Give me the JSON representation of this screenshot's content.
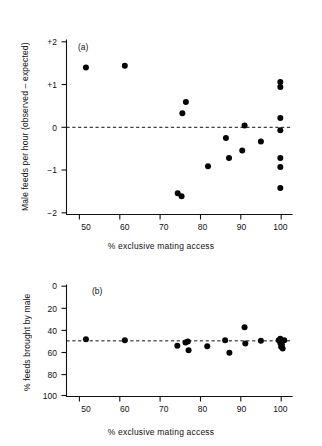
{
  "figure": {
    "background": "#ffffff",
    "ink": "#111111",
    "dot_color": "#050505",
    "width": 322,
    "height": 446
  },
  "panel_a": {
    "tag": "(a)",
    "xlabel": "% exclusive mating access",
    "ylabel": "Male feeds per hour (observed – expected)",
    "xticks": [
      "50",
      "60",
      "70",
      "80",
      "90",
      "100"
    ],
    "yticks": [
      "+2",
      "+1",
      "0",
      "−1",
      "−2"
    ]
  },
  "panel_b": {
    "tag": "(b)",
    "xlabel": "% exclusive mating access",
    "ylabel": "% feeds brought by male",
    "xticks": [
      "50",
      "60",
      "70",
      "80",
      "90",
      "100"
    ],
    "yticks": [
      "100",
      "80",
      "60",
      "40",
      "20",
      "0"
    ]
  },
  "chart_data": [
    {
      "type": "scatter",
      "panel": "(a)",
      "title": "",
      "xlabel": "% exclusive mating access",
      "ylabel": "Male feeds per hour (observed – expected)",
      "xlim": [
        45,
        103
      ],
      "ylim": [
        -2,
        2
      ],
      "xticks": [
        50,
        60,
        70,
        80,
        90,
        100
      ],
      "yticks": [
        2,
        1,
        0,
        -1,
        -2
      ],
      "ytick_labels": [
        "+2",
        "+1",
        "0",
        "−1",
        "−2"
      ],
      "grid": false,
      "legend": "none",
      "reference_line": {
        "orientation": "horizontal",
        "y": 0,
        "style": "dashed"
      },
      "points": [
        {
          "x": 50.0,
          "y": 1.4
        },
        {
          "x": 60.0,
          "y": 1.44
        },
        {
          "x": 73.6,
          "y": -1.54
        },
        {
          "x": 74.6,
          "y": -1.61
        },
        {
          "x": 74.8,
          "y": 0.33
        },
        {
          "x": 75.7,
          "y": 0.59
        },
        {
          "x": 81.4,
          "y": -0.91
        },
        {
          "x": 86.0,
          "y": -0.25
        },
        {
          "x": 86.8,
          "y": -0.72
        },
        {
          "x": 90.2,
          "y": -0.54
        },
        {
          "x": 90.8,
          "y": 0.04
        },
        {
          "x": 95.0,
          "y": -0.33
        },
        {
          "x": 100.0,
          "y": 1.06
        },
        {
          "x": 100.0,
          "y": 0.94
        },
        {
          "x": 100.0,
          "y": 0.22
        },
        {
          "x": 100.0,
          "y": -0.07
        },
        {
          "x": 100.0,
          "y": -0.72
        },
        {
          "x": 100.0,
          "y": -0.93
        },
        {
          "x": 100.0,
          "y": -1.42
        }
      ]
    },
    {
      "type": "scatter",
      "panel": "(b)",
      "title": "",
      "xlabel": "% exclusive mating access",
      "ylabel": "% feeds brought by male",
      "xlim": [
        45,
        103
      ],
      "ylim": [
        0,
        100
      ],
      "xticks": [
        50,
        60,
        70,
        80,
        90,
        100
      ],
      "yticks": [
        0,
        20,
        40,
        60,
        80,
        100
      ],
      "grid": false,
      "legend": "none",
      "reference_line": {
        "orientation": "horizontal",
        "y": 50,
        "style": "dashed"
      },
      "points": [
        {
          "x": 50.0,
          "y": 51.5
        },
        {
          "x": 60.0,
          "y": 50.5
        },
        {
          "x": 73.5,
          "y": 45.5
        },
        {
          "x": 75.6,
          "y": 48.5
        },
        {
          "x": 76.2,
          "y": 49.5
        },
        {
          "x": 76.4,
          "y": 41.5
        },
        {
          "x": 81.2,
          "y": 45.0
        },
        {
          "x": 85.8,
          "y": 50.5
        },
        {
          "x": 86.9,
          "y": 39.0
        },
        {
          "x": 90.8,
          "y": 62.5
        },
        {
          "x": 91.0,
          "y": 47.5
        },
        {
          "x": 95.0,
          "y": 50.0
        },
        {
          "x": 99.6,
          "y": 50.5
        },
        {
          "x": 100.0,
          "y": 52.0
        },
        {
          "x": 100.0,
          "y": 48.0
        },
        {
          "x": 100.2,
          "y": 44.5
        },
        {
          "x": 100.4,
          "y": 46.5
        },
        {
          "x": 100.6,
          "y": 43.0
        },
        {
          "x": 101.0,
          "y": 50.5
        }
      ]
    }
  ]
}
